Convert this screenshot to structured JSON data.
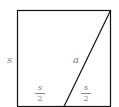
{
  "diagram": {
    "shape": "square",
    "labels": {
      "side": "s",
      "diagonal_segment": "a",
      "left_half": {
        "numerator": "s",
        "denominator": "2"
      },
      "right_half": {
        "numerator": "s",
        "denominator": "2"
      }
    },
    "colors": {
      "stroke": "#111111",
      "label": "#777777"
    }
  }
}
